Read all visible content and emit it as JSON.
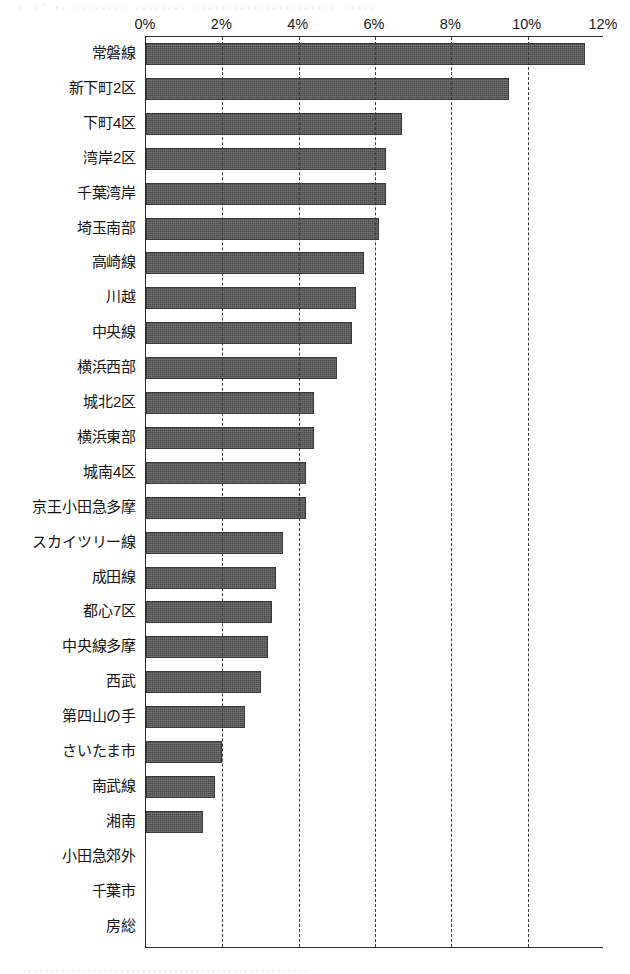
{
  "scan": {
    "top_fragment": "。 ．・ ，．   ．．．．．．．．  ．．．．．．．． ．．．．．．．．．．．．．．．．．．．．．．  ．．．．．",
    "bottom_fragment": "．．．．．．．．．．．．．．．．．．．．．．．．．．．．．．．．．．．．．．．．．．．．．．．．．．．．．"
  },
  "chart_data": {
    "type": "bar",
    "orientation": "horizontal",
    "title": "",
    "subtitle": "",
    "xlabel": "",
    "ylabel": "",
    "xlim": [
      0,
      12
    ],
    "x_tick_values": [
      0,
      2,
      4,
      6,
      8,
      10,
      12
    ],
    "x_tick_labels": [
      "0%",
      "2%",
      "4%",
      "6%",
      "8%",
      "10%",
      "12%"
    ],
    "grid": true,
    "grid_axis": "x",
    "grid_style": "dashed",
    "legend": false,
    "legend_position": "none",
    "bar_color": "#4b4b4b",
    "axis_color": "#2b2b2b",
    "categories": [
      "常磐線",
      "新下町2区",
      "下町4区",
      "湾岸2区",
      "千葉湾岸",
      "埼玉南部",
      "高崎線",
      "川越",
      "中央線",
      "横浜西部",
      "城北2区",
      "横浜東部",
      "城南4区",
      "京王小田急多摩",
      "スカイツリー線",
      "成田線",
      "都心7区",
      "中央線多摩",
      "西武",
      "第四山の手",
      "さいたま市",
      "南武線",
      "湘南",
      "小田急郊外",
      "千葉市",
      "房総"
    ],
    "values": [
      11.5,
      9.5,
      6.7,
      6.3,
      6.3,
      6.1,
      5.7,
      5.5,
      5.4,
      5.0,
      4.4,
      4.4,
      4.2,
      4.2,
      3.6,
      3.4,
      3.3,
      3.2,
      3.0,
      2.6,
      2.0,
      1.8,
      1.5,
      0,
      0,
      0
    ]
  }
}
